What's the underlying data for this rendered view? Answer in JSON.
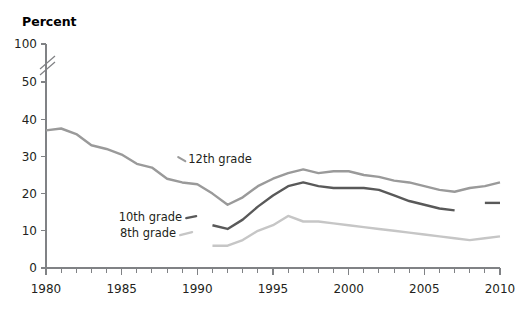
{
  "chart_data": {
    "type": "line",
    "title": "",
    "ylabel": "Percent",
    "xlabel": "",
    "ylim": [
      0,
      50
    ],
    "xlim": [
      1980,
      2010
    ],
    "grid": false,
    "legend_position": "inline-annotations",
    "y_axis_break": {
      "present": true,
      "between": [
        50,
        100
      ],
      "symbol": "double-slash"
    },
    "y_ticks": [
      "0",
      "10",
      "20",
      "30",
      "40",
      "50",
      "100"
    ],
    "x_ticks": [
      "1980",
      "1985",
      "1990",
      "1995",
      "2000",
      "2005",
      "2010"
    ],
    "x_minor_tick_interval": 1,
    "series": [
      {
        "name": "12th grade",
        "color": "#9a9a9a",
        "x": [
          1980,
          1981,
          1982,
          1983,
          1984,
          1985,
          1986,
          1987,
          1988,
          1989,
          1990,
          1991,
          1992,
          1993,
          1994,
          1995,
          1996,
          1997,
          1998,
          1999,
          2000,
          2001,
          2002,
          2003,
          2004,
          2005,
          2006,
          2007,
          2008,
          2009,
          2010
        ],
        "values": [
          37.0,
          37.5,
          36.0,
          33.0,
          32.0,
          30.5,
          28.0,
          27.0,
          24.0,
          23.0,
          22.5,
          20.0,
          17.0,
          19.0,
          22.0,
          24.0,
          25.5,
          26.5,
          25.5,
          26.0,
          26.0,
          25.0,
          24.5,
          23.5,
          23.0,
          22.0,
          21.0,
          20.5,
          21.5,
          22.0,
          23.0
        ]
      },
      {
        "name": "10th grade",
        "color": "#595959",
        "x": [
          1991,
          1992,
          1993,
          1994,
          1995,
          1996,
          1997,
          1998,
          1999,
          2000,
          2001,
          2002,
          2003,
          2004,
          2005,
          2006,
          2007
        ],
        "values": [
          11.5,
          10.5,
          13.0,
          16.5,
          19.5,
          22.0,
          23.0,
          22.0,
          21.5,
          21.5,
          21.5,
          21.0,
          19.5,
          18.0,
          17.0,
          16.0,
          15.5
        ],
        "segment_break_after": 2007
      },
      {
        "name": "10th grade",
        "series_continuation": true,
        "color": "#595959",
        "x": [
          2009,
          2010
        ],
        "values": [
          17.5,
          17.5
        ]
      },
      {
        "name": "8th grade",
        "color": "#c6c6c6",
        "x": [
          1991,
          1992,
          1993,
          1994,
          1995,
          1996,
          1997,
          1998,
          1999,
          2000,
          2001,
          2002,
          2003,
          2004,
          2005,
          2006,
          2007,
          2008,
          2009,
          2010
        ],
        "values": [
          6.0,
          6.0,
          7.5,
          10.0,
          11.5,
          14.0,
          12.5,
          12.5,
          12.0,
          11.5,
          11.0,
          10.5,
          10.0,
          9.5,
          9.0,
          8.5,
          8.0,
          7.5,
          8.0,
          8.5
        ]
      }
    ],
    "annotations": [
      {
        "label": "12th grade",
        "x": 1989.4,
        "y": 28.2
      },
      {
        "label": "10th grade",
        "x": 1989.0,
        "y": 12.6
      },
      {
        "label": "8th grade",
        "x": 1988.6,
        "y": 8.3
      }
    ]
  }
}
